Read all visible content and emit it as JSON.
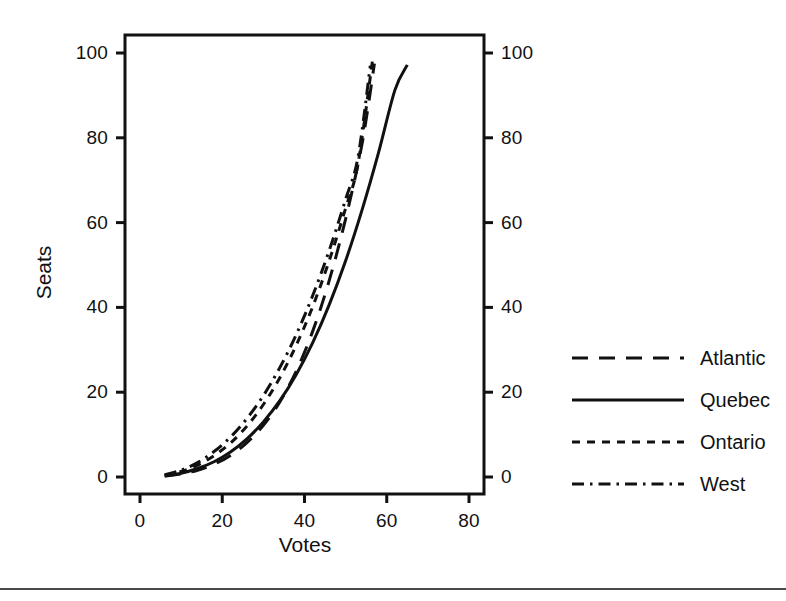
{
  "figure": {
    "background_color": "#ffffff",
    "ink_color": "#111111",
    "rule_color": "#4a4a4a",
    "axis_title_x": "Votes",
    "axis_title_y": "Seats"
  },
  "chart_data": {
    "type": "line",
    "title": "",
    "xlabel": "Votes",
    "ylabel": "Seats",
    "xlim": [
      -2,
      86
    ],
    "ylim": [
      -3,
      104
    ],
    "xticks": [
      0,
      20,
      40,
      60,
      80
    ],
    "yticks": [
      0,
      20,
      40,
      60,
      80,
      100
    ],
    "xtick_labels": [
      "0",
      "20",
      "40",
      "60",
      "80"
    ],
    "ytick_labels": [
      "0",
      "20",
      "40",
      "60",
      "80",
      "100"
    ],
    "right_axis": true,
    "right_ytick_labels": [
      "0",
      "20",
      "40",
      "60",
      "80",
      "100"
    ],
    "grid": false,
    "legend_position": "right-outside",
    "series": [
      {
        "name": "Atlantic",
        "dash": "long-dash",
        "dasharray": "16,11",
        "width": 3,
        "x": [
          6,
          10,
          14,
          18,
          22,
          26,
          30,
          34,
          38,
          42,
          46,
          50,
          54,
          57
        ],
        "y": [
          0.2,
          0.7,
          1.6,
          3.0,
          5.1,
          8.1,
          12.2,
          17.7,
          25.0,
          34.4,
          46.3,
          60.9,
          78.6,
          97.5
        ]
      },
      {
        "name": "Quebec",
        "dash": "solid",
        "dasharray": "",
        "width": 3,
        "x": [
          6,
          10,
          14,
          18,
          22,
          26,
          30,
          34,
          38,
          42,
          46,
          50,
          54,
          58,
          62,
          65
        ],
        "y": [
          0.3,
          0.9,
          2.0,
          3.6,
          5.9,
          9.0,
          13.0,
          18.0,
          24.2,
          31.7,
          40.6,
          51.0,
          63.0,
          76.5,
          91.3,
          97.2
        ]
      },
      {
        "name": "Ontario",
        "dash": "short-dash",
        "dasharray": "8,7",
        "width": 3,
        "x": [
          6,
          10,
          14,
          18,
          22,
          26,
          30,
          34,
          38,
          42,
          46,
          50,
          53,
          56.5
        ],
        "y": [
          0.4,
          1.3,
          2.8,
          5.0,
          8.0,
          12.0,
          17.1,
          23.4,
          31.1,
          40.2,
          51.0,
          63.4,
          73.8,
          98.0
        ]
      },
      {
        "name": "West",
        "dash": "dash-dot",
        "dasharray": "12,6,2.5,6",
        "width": 3,
        "x": [
          6,
          10,
          14,
          18,
          22,
          26,
          30,
          34,
          38,
          42,
          46,
          50,
          53,
          56
        ],
        "y": [
          0.5,
          1.6,
          3.4,
          6.0,
          9.4,
          13.8,
          19.2,
          25.8,
          33.6,
          42.8,
          53.4,
          65.5,
          75.4,
          97.0
        ]
      }
    ]
  },
  "legend": {
    "items": [
      {
        "label": "Atlantic"
      },
      {
        "label": "Quebec"
      },
      {
        "label": "Ontario"
      },
      {
        "label": "West"
      }
    ]
  }
}
